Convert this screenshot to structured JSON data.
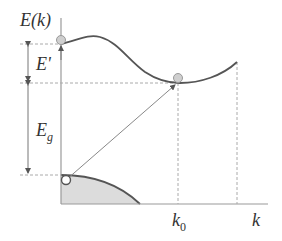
{
  "diagram": {
    "labels": {
      "y_axis": "E(k)",
      "x_axis": "k",
      "k0": "k",
      "k0_sub": "0",
      "e_prime": "E'",
      "eg": "E",
      "eg_sub": "g"
    },
    "elements": {
      "conduction_band": "curve with local maximum near k=0 and minimum at k0",
      "valence_band": "shaded region with maximum at k=0",
      "electron": "filled gray circle at conduction band minimum (k0) and at k=0",
      "hole": "open circle at valence band maximum",
      "transition": "diagonal arrow from valence band top to conduction band minimum"
    },
    "colors": {
      "curve": "#555555",
      "axis": "#9a9a9a",
      "dashed": "#aaaaaa",
      "valence_fill": "#dcdcdc",
      "electron_fill": "#cfcfcf",
      "text": "#333333"
    }
  }
}
